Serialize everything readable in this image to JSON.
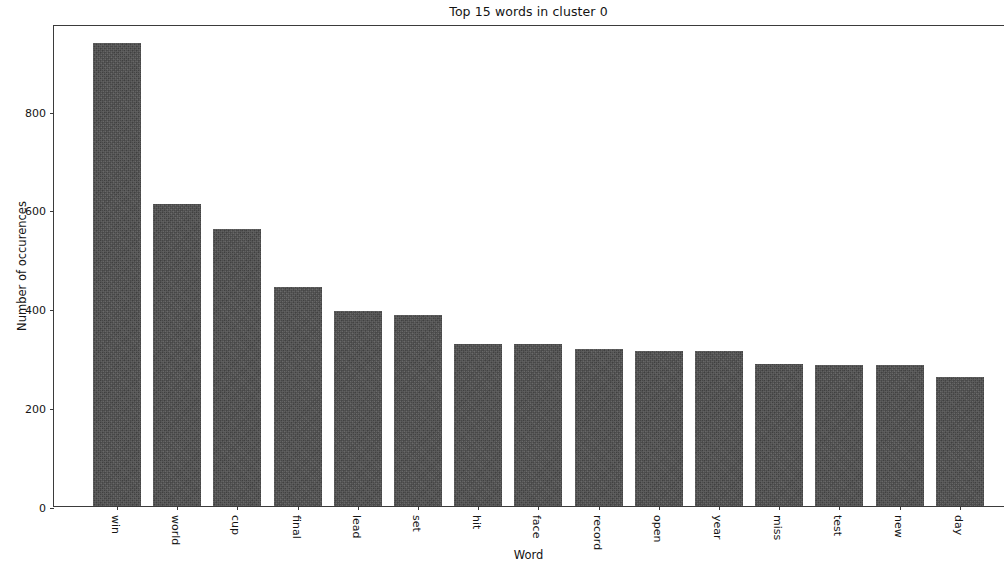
{
  "chart_data": {
    "type": "bar",
    "title": "Top 15 words in cluster 0",
    "xlabel": "Word",
    "ylabel": "Number of occurences",
    "categories": [
      "win",
      "world",
      "cup",
      "final",
      "lead",
      "set",
      "hit",
      "face",
      "record",
      "open",
      "year",
      "miss",
      "test",
      "new",
      "day"
    ],
    "values": [
      936,
      611,
      560,
      443,
      394,
      386,
      327,
      327,
      317,
      313,
      313,
      288,
      286,
      286,
      260
    ],
    "ylim": [
      0,
      975
    ],
    "yticks": [
      0,
      200,
      400,
      600,
      800
    ],
    "ytick_labels": [
      "0",
      "200",
      "400",
      "600",
      "800"
    ],
    "grid": false,
    "legend": false,
    "bar_color": "#4c4c4c",
    "background_color": "#ffffff",
    "axis_color": "#3b3b3b"
  },
  "figure": {
    "title": "Top 15 words in cluster 0",
    "xlabel": "Word",
    "ylabel": "Number of occurences"
  }
}
